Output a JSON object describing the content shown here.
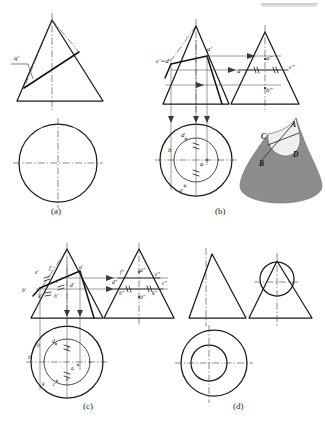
{
  "figure": {
    "panels": [
      {
        "id": "a",
        "label": "(a)",
        "caption_x": 58,
        "caption_y": 214
      },
      {
        "id": "b",
        "label": "(b)",
        "caption_x": 222,
        "caption_y": 214
      },
      {
        "id": "c",
        "label": "(c)",
        "caption_x": 90,
        "caption_y": 409
      },
      {
        "id": "d",
        "label": "(d)",
        "caption_x": 240,
        "caption_y": 409
      }
    ],
    "colors": {
      "outline": "#1a1a1a",
      "center_line": "#3a3a3a",
      "projection_line": "#4a4a4a",
      "cone_shade": "#8d8d8d",
      "cut_face": "#efefef",
      "label_text": "#1d1d1d"
    }
  },
  "panel_a": {
    "labels": [
      {
        "text": "q'",
        "x": 18,
        "y": 57
      }
    ]
  },
  "panel_b": {
    "front_labels": [
      {
        "text": "c'=d'",
        "x": 161,
        "y": 62
      },
      {
        "text": "a'",
        "x": 209,
        "y": 48
      }
    ],
    "side_labels": [
      {
        "text": "a\"",
        "x": 264,
        "y": 66
      },
      {
        "text": "d\"",
        "x": 240,
        "y": 78
      },
      {
        "text": "c\"",
        "x": 295,
        "y": 72
      },
      {
        "text": "b\"",
        "x": 264,
        "y": 93
      }
    ],
    "top_labels": [
      {
        "text": "d",
        "x": 184,
        "y": 136
      },
      {
        "text": "b",
        "x": 171,
        "y": 150
      },
      {
        "text": "a",
        "x": 203,
        "y": 163
      },
      {
        "text": "c",
        "x": 182,
        "y": 190
      }
    ],
    "solid_labels": [
      {
        "text": "A",
        "x": 290,
        "y": 128
      },
      {
        "text": "C",
        "x": 265,
        "y": 139
      },
      {
        "text": "B",
        "x": 262,
        "y": 163
      },
      {
        "text": "D",
        "x": 290,
        "y": 157
      }
    ]
  },
  "panel_c": {
    "front_labels": [
      {
        "text": "e'",
        "x": 38,
        "y": 272
      },
      {
        "text": "f'",
        "x": 51,
        "y": 268
      },
      {
        "text": "a'",
        "x": 80,
        "y": 268
      },
      {
        "text": "c'",
        "x": 58,
        "y": 281
      },
      {
        "text": "d'",
        "x": 71,
        "y": 285
      },
      {
        "text": "b'",
        "x": 25,
        "y": 290
      },
      {
        "text": "k'",
        "x": 40,
        "y": 296
      },
      {
        "text": "h'",
        "x": 56,
        "y": 296
      }
    ],
    "side_labels": [
      {
        "text": "f\"",
        "x": 122,
        "y": 272
      },
      {
        "text": "a\"",
        "x": 140,
        "y": 270
      },
      {
        "text": "e\"",
        "x": 157,
        "y": 274
      },
      {
        "text": "c\"",
        "x": 163,
        "y": 283
      },
      {
        "text": "d\"",
        "x": 116,
        "y": 282
      },
      {
        "text": "h\"",
        "x": 122,
        "y": 292
      },
      {
        "text": "b\"",
        "x": 141,
        "y": 295
      },
      {
        "text": "k\"",
        "x": 154,
        "y": 292
      }
    ],
    "top_labels": [
      {
        "text": "h",
        "x": 40,
        "y": 345
      },
      {
        "text": "d",
        "x": 54,
        "y": 341
      },
      {
        "text": "f",
        "x": 68,
        "y": 348
      },
      {
        "text": "b",
        "x": 31,
        "y": 357
      },
      {
        "text": "a",
        "x": 72,
        "y": 368
      },
      {
        "text": "k",
        "x": 44,
        "y": 383
      },
      {
        "text": "c",
        "x": 55,
        "y": 383
      },
      {
        "text": "e",
        "x": 68,
        "y": 378
      }
    ]
  },
  "panel_d": {
    "labels": []
  }
}
